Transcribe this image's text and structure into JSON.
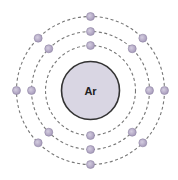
{
  "diagram": {
    "type": "bohr-model",
    "element_symbol": "Ar",
    "center": [
      90.5,
      90.5
    ],
    "nucleus": {
      "radius": 29,
      "fill": "#d9d6e3",
      "stroke": "#333333"
    },
    "orbit_style": {
      "stroke": "#777777",
      "dash": "3,2.5"
    },
    "electron_style": {
      "radius": 4,
      "fill": "#a89cbc",
      "highlight": "#d4cde0"
    },
    "shells": [
      {
        "name": "shell-1",
        "radius": 45,
        "electron_count": 2,
        "angles": [
          90,
          270
        ]
      },
      {
        "name": "shell-2",
        "radius": 59,
        "electron_count": 8,
        "angles": [
          0,
          45,
          90,
          135,
          180,
          225,
          270,
          315
        ]
      },
      {
        "name": "shell-3",
        "radius": 74,
        "electron_count": 8,
        "angles": [
          0,
          45,
          90,
          135,
          180,
          225,
          270,
          315
        ]
      }
    ]
  }
}
